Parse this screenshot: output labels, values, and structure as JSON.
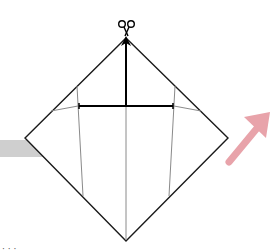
{
  "diagram": {
    "type": "origami-step",
    "colors": {
      "outline": "#1a1a1a",
      "crease": "#777777",
      "arrow_bold": "#000000",
      "next_arrow": "#e8a3aa",
      "prev_bar": "#c9c9c9",
      "background": "#ffffff"
    },
    "icons": {
      "cut": "scissors-icon",
      "next": "pink-arrow-up-right-icon",
      "prev": "gray-bar"
    }
  },
  "caption": {
    "text": "· · ·"
  }
}
